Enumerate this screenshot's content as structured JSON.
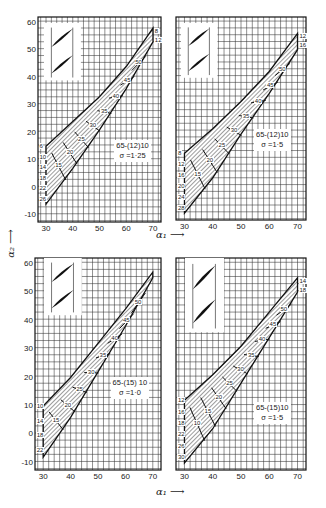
{
  "chart_data": [
    {
      "type": "line",
      "title": "65-(12)10, σ = 1·25",
      "profile": "65-(12)10",
      "solidity": "σ =1·25",
      "xlabel": "α1",
      "ylabel": "α2",
      "xlim": [
        30,
        70
      ],
      "ylim": [
        -10,
        60
      ],
      "xticks": [
        30,
        40,
        50,
        60,
        70
      ],
      "yticks": [
        -10,
        0,
        10,
        20,
        30,
        40,
        50,
        60
      ],
      "grid": true,
      "incidence_labels": [
        "6",
        "10",
        "14",
        "18",
        "22",
        "26",
        "8",
        "12"
      ],
      "deflection_labels": [
        "15",
        "20",
        "25",
        "30",
        "35",
        "40",
        "45",
        "50"
      ],
      "envelope_upper": [
        [
          30,
          15
        ],
        [
          40,
          24
        ],
        [
          50,
          33
        ],
        [
          60,
          44
        ],
        [
          70,
          58
        ]
      ],
      "envelope_lower": [
        [
          30,
          -6
        ],
        [
          40,
          7
        ],
        [
          50,
          21
        ],
        [
          60,
          36
        ],
        [
          70,
          53
        ]
      ]
    },
    {
      "type": "line",
      "title": "65-(12)10, σ = 1·5",
      "profile": "65-(12)10",
      "solidity": "σ =1·5",
      "xlabel": "α1",
      "ylabel": "α2",
      "xlim": [
        30,
        70
      ],
      "ylim": [
        -10,
        60
      ],
      "xticks": [
        30,
        40,
        50,
        60,
        70
      ],
      "grid": true,
      "incidence_labels": [
        "8",
        "12",
        "16",
        "20",
        "24",
        "28",
        "12",
        "16"
      ],
      "deflection_labels": [
        "15",
        "20",
        "25",
        "30",
        "35",
        "40",
        "45",
        "50"
      ],
      "envelope_upper": [
        [
          30,
          12
        ],
        [
          40,
          21
        ],
        [
          50,
          31
        ],
        [
          60,
          42
        ],
        [
          70,
          56
        ]
      ],
      "envelope_lower": [
        [
          30,
          -10
        ],
        [
          40,
          3
        ],
        [
          50,
          19
        ],
        [
          60,
          34
        ],
        [
          70,
          50
        ]
      ]
    },
    {
      "type": "line",
      "title": "65-(15)10, σ = 1·0",
      "profile": "65-(15)10",
      "solidity": "σ =1·0",
      "xlabel": "α1",
      "ylabel": "α2",
      "xlim": [
        30,
        70
      ],
      "ylim": [
        -10,
        60
      ],
      "xticks": [
        30,
        40,
        50,
        60,
        70
      ],
      "yticks": [
        -10,
        0,
        10,
        20,
        30,
        40,
        50,
        60
      ],
      "grid": true,
      "incidence_labels": [
        "10",
        "14",
        "18",
        "22"
      ],
      "deflection_labels": [
        "15",
        "20",
        "25",
        "30",
        "35",
        "40",
        "45",
        "50"
      ],
      "envelope_upper": [
        [
          30,
          10
        ],
        [
          40,
          20
        ],
        [
          50,
          32
        ],
        [
          60,
          44
        ],
        [
          70,
          57
        ]
      ],
      "envelope_lower": [
        [
          30,
          -8
        ],
        [
          40,
          6
        ],
        [
          50,
          22
        ],
        [
          60,
          38
        ],
        [
          70,
          55
        ]
      ]
    },
    {
      "type": "line",
      "title": "65-(15)10, σ = 1·5",
      "profile": "65-(15)10",
      "solidity": "σ =1·5",
      "xlabel": "α1",
      "ylabel": "α2",
      "xlim": [
        30,
        70
      ],
      "ylim": [
        -10,
        60
      ],
      "xticks": [
        30,
        40,
        50,
        60,
        70
      ],
      "grid": true,
      "incidence_labels": [
        "12",
        "16",
        "18",
        "22",
        "26",
        "30",
        "14",
        "18"
      ],
      "deflection_labels": [
        "10",
        "15",
        "20",
        "25",
        "30",
        "35",
        "40",
        "45",
        "50"
      ],
      "envelope_upper": [
        [
          30,
          12
        ],
        [
          40,
          21
        ],
        [
          50,
          31
        ],
        [
          60,
          43
        ],
        [
          70,
          55
        ]
      ],
      "envelope_lower": [
        [
          30,
          -10
        ],
        [
          40,
          2
        ],
        [
          50,
          18
        ],
        [
          60,
          34
        ],
        [
          70,
          50
        ]
      ]
    }
  ],
  "labels": {
    "x_axis_title": "α₁ ⟶",
    "y_axis_title": "α₂ ⟶",
    "y_ticks": [
      "60",
      "50",
      "40",
      "30",
      "20",
      "10",
      "0",
      "-10"
    ],
    "x_ticks": [
      "30",
      "40",
      "50",
      "60",
      "70"
    ]
  },
  "panels": [
    {
      "legend1": "65-(12)10",
      "legend2": "σ =1·25",
      "left_labels": [
        "6",
        "10",
        "14",
        "18",
        "22",
        "26"
      ],
      "right_labels": [
        "8",
        "12"
      ],
      "inner_labels": [
        "15",
        "20",
        "25",
        "30",
        "35",
        "40",
        "45",
        "50"
      ]
    },
    {
      "legend1": "65-(12)10",
      "legend2": "σ =1·5",
      "left_labels": [
        "8",
        "12",
        "16",
        "20",
        "24",
        "28"
      ],
      "right_labels": [
        "12",
        "16"
      ],
      "inner_labels": [
        "15",
        "20",
        "25",
        "30",
        "35",
        "40",
        "45",
        "50"
      ]
    },
    {
      "legend1": "65-(15) 10",
      "legend2": "σ =1·0",
      "left_labels": [
        "10",
        "14",
        "18",
        "22"
      ],
      "right_labels": [],
      "inner_labels": [
        "15",
        "20",
        "25",
        "30",
        "35",
        "40",
        "45",
        "50"
      ]
    },
    {
      "legend1": "65-(15)10",
      "legend2": "σ =1·5",
      "left_labels": [
        "12",
        "16",
        "18",
        "22",
        "26",
        "30"
      ],
      "right_labels": [
        "14",
        "18"
      ],
      "inner_labels": [
        "10",
        "15",
        "20",
        "25",
        "30",
        "35",
        "40",
        "45",
        "50"
      ]
    }
  ]
}
